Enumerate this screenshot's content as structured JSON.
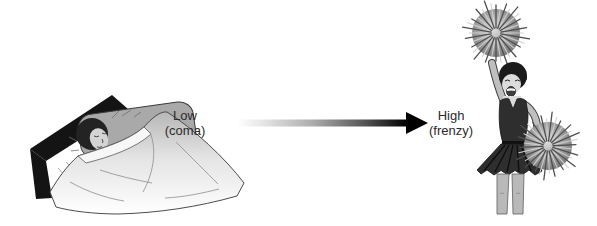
{
  "labels": {
    "low": {
      "level": "Low",
      "state": "(coma)"
    },
    "high": {
      "level": "High",
      "state": "(frenzy)"
    }
  },
  "arrow": {
    "direction": "left-to-right",
    "gradient_start_color": "#ffffff",
    "gradient_end_color": "#000000"
  },
  "illustrations": {
    "left": "sleeping-person-in-bed",
    "right": "cheerleader-with-pom-poms"
  },
  "colors": {
    "background": "#ffffff",
    "text": "#2b2b2b"
  }
}
